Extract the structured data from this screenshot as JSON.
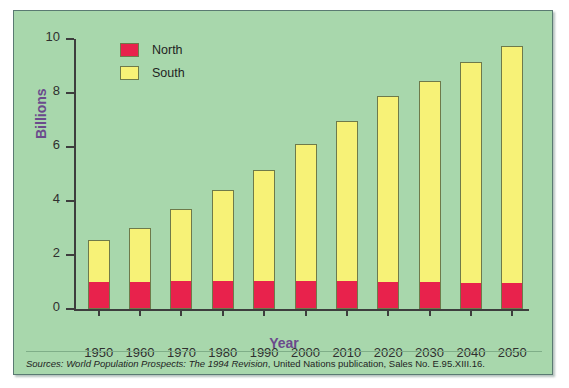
{
  "chart_data": {
    "type": "bar",
    "subtype": "stacked",
    "title": "",
    "xlabel": "Year",
    "ylabel": "Billions",
    "ylim": [
      0,
      10
    ],
    "yticks": [
      "0",
      "2",
      "4",
      "6",
      "8",
      "10"
    ],
    "grid": false,
    "legend_position": "top-left",
    "categories": [
      "1950",
      "1960",
      "1970",
      "1980",
      "1990",
      "2000",
      "2010",
      "2020",
      "2030",
      "2040",
      "2050"
    ],
    "series": [
      {
        "name": "North",
        "color": "#e8224c",
        "values": [
          1.0,
          1.0,
          1.05,
          1.05,
          1.05,
          1.05,
          1.05,
          1.0,
          1.0,
          0.95,
          0.95
        ]
      },
      {
        "name": "South",
        "color": "#f7f277",
        "values": [
          1.55,
          2.0,
          2.65,
          3.35,
          4.1,
          5.05,
          5.9,
          6.9,
          7.45,
          8.2,
          8.8
        ]
      }
    ],
    "totals": [
      2.55,
      3.0,
      3.7,
      4.4,
      5.15,
      6.1,
      6.95,
      7.9,
      8.45,
      9.15,
      9.75
    ]
  },
  "legend": {
    "items": [
      {
        "label": "North",
        "color": "#e8224c"
      },
      {
        "label": "South",
        "color": "#f7f277"
      }
    ]
  },
  "axes": {
    "y_title": "Billions",
    "x_title": "Year"
  },
  "footnote": {
    "prefix": "Sources:",
    "title": "World Population Prospects: The 1994 Revision",
    "suffix": ", United Nations publication, Sales No. E.95.XIII.16."
  },
  "colors": {
    "background": "#a8d7ac",
    "north": "#e8224c",
    "south": "#f7f277",
    "axis_title": "#6b4a8c",
    "bar_outline": "#6e7a4a",
    "axis": "#3d3d3d"
  }
}
